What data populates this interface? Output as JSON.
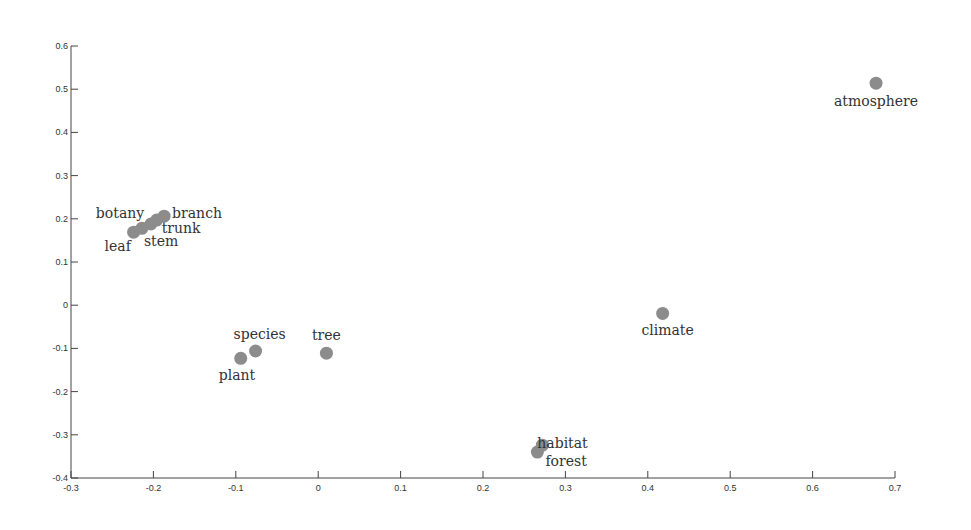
{
  "chart_data": {
    "type": "scatter",
    "title": "",
    "xlabel": "",
    "ylabel": "",
    "xlim": [
      -0.3,
      0.7
    ],
    "ylim": [
      -0.4,
      0.6
    ],
    "grid": false,
    "legend": null,
    "x_ticks": [
      "-0.3",
      "-0.2",
      "-0.1",
      "0",
      "0.1",
      "0.2",
      "0.3",
      "0.4",
      "0.5",
      "0.6",
      "0.7"
    ],
    "y_ticks": [
      "0.6",
      "0.5",
      "0.4",
      "0.3",
      "0.2",
      "0.1",
      "0",
      "-0.1",
      "-0.2",
      "-0.3",
      "-0.4"
    ],
    "marker_color": "#8c8c8c",
    "points": [
      {
        "label": "leaf",
        "x": -0.224,
        "y": 0.169
      },
      {
        "label": "botany",
        "x": -0.214,
        "y": 0.178
      },
      {
        "label": "stem",
        "x": -0.203,
        "y": 0.188
      },
      {
        "label": "trunk",
        "x": -0.196,
        "y": 0.197
      },
      {
        "label": "branch",
        "x": -0.187,
        "y": 0.206
      },
      {
        "label": "plant",
        "x": -0.094,
        "y": -0.123
      },
      {
        "label": "species",
        "x": -0.076,
        "y": -0.106
      },
      {
        "label": "tree",
        "x": 0.01,
        "y": -0.111
      },
      {
        "label": "habitat",
        "x": 0.272,
        "y": -0.324
      },
      {
        "label": "forest",
        "x": 0.266,
        "y": -0.34
      },
      {
        "label": "climate",
        "x": 0.418,
        "y": -0.019
      },
      {
        "label": "atmosphere",
        "x": 0.677,
        "y": 0.514
      }
    ]
  }
}
